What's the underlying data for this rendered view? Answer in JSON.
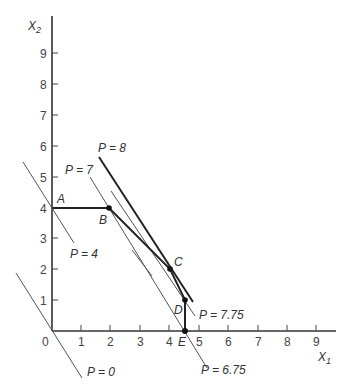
{
  "axes": {
    "x_label": "X",
    "x_label_sub": "1",
    "y_label": "X",
    "y_label_sub": "2",
    "origin_label": "0",
    "x_ticks": [
      "1",
      "2",
      "3",
      "4",
      "5",
      "6",
      "7",
      "8",
      "9"
    ],
    "y_ticks": [
      "1",
      "2",
      "3",
      "4",
      "5",
      "6",
      "7",
      "8",
      "9"
    ]
  },
  "points": {
    "A": "A",
    "B": "B",
    "C": "C",
    "D": "D",
    "E": "E"
  },
  "isoprofit_labels": {
    "p0": "P = 0",
    "p4": "P = 4",
    "p7": "P = 7",
    "p8": "P = 8",
    "p675": "P = 6.75",
    "p775": "P = 7.75"
  },
  "colors": {
    "axis": "#333333",
    "frontier": "#222222",
    "isoprofit": "#555555"
  }
}
